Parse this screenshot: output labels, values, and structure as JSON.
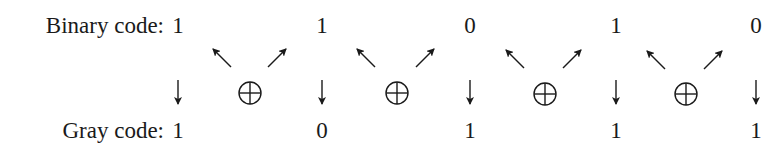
{
  "diagram": {
    "rows": {
      "binary": {
        "label": "Binary code:",
        "bits": [
          "1",
          "1",
          "0",
          "1",
          "0"
        ]
      },
      "gray": {
        "label": "Gray code:",
        "bits": [
          "1",
          "0",
          "1",
          "1",
          "1"
        ]
      }
    },
    "operator_symbol": "⊕",
    "operator_name": "xor",
    "column_x": [
      178,
      322,
      470,
      616,
      756
    ],
    "operator_x": [
      250,
      397,
      545,
      686
    ],
    "ink_color": "#1a1a1a"
  }
}
